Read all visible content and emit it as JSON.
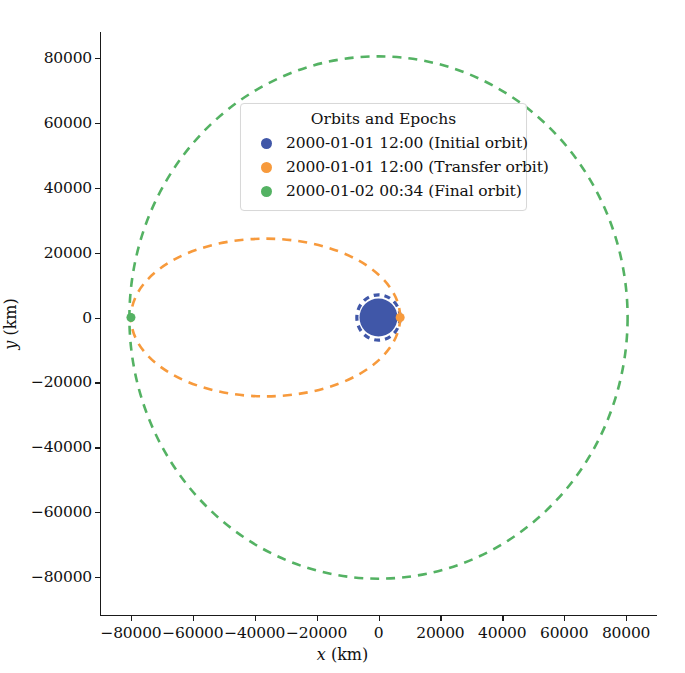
{
  "chart_data": {
    "type": "line",
    "title": "",
    "xlabel": "x (km)",
    "ylabel": "y (km)",
    "xlim": [
      -90000,
      90000
    ],
    "ylim": [
      -92000,
      88000
    ],
    "xticks": [
      "-80000",
      "-60000",
      "-40000",
      "-20000",
      "0",
      "20000",
      "40000",
      "60000",
      "80000"
    ],
    "xtick_values": [
      -80000,
      -60000,
      -40000,
      -20000,
      0,
      20000,
      40000,
      60000,
      80000
    ],
    "yticks": [
      "80000",
      "60000",
      "40000",
      "20000",
      "0",
      "-20000",
      "-40000",
      "-60000",
      "-80000"
    ],
    "ytick_values": [
      80000,
      60000,
      40000,
      20000,
      0,
      -20000,
      -40000,
      -60000,
      -80000
    ],
    "grid": false,
    "legend_position": "upper center",
    "legend_title": "Orbits and Epochs",
    "series": [
      {
        "name": "2000-01-01 12:00 (Initial orbit)",
        "label": "2000-01-01 12:00 (Initial orbit)",
        "color": "#4057a8",
        "style": "dashed",
        "shape": "circle",
        "center": [
          0,
          0
        ],
        "semi_major_axis": 7000,
        "semi_minor_axis": 7000,
        "marker_point": [
          0,
          0
        ],
        "marker_size": 38
      },
      {
        "name": "2000-01-01 12:00 (Transfer orbit)",
        "label": "2000-01-01 12:00 (Transfer orbit)",
        "color": "#f79a3c",
        "style": "dashed",
        "shape": "ellipse",
        "center": [
          -36500,
          0
        ],
        "semi_major_axis": 43500,
        "semi_minor_axis": 24300,
        "marker_point": [
          7000,
          0
        ],
        "marker_size": 9
      },
      {
        "name": "2000-01-02 00:34 (Final orbit)",
        "label": "2000-01-02 00:34 (Final orbit)",
        "color": "#54b263",
        "style": "dashed",
        "shape": "circle",
        "center": [
          0,
          0
        ],
        "semi_major_axis": 80500,
        "semi_minor_axis": 80500,
        "marker_point": [
          -80000,
          0
        ],
        "marker_size": 9
      }
    ]
  },
  "legend": {
    "title": "Orbits and Epochs",
    "items": [
      {
        "label": "2000-01-01 12:00 (Initial orbit)",
        "color": "#4057a8"
      },
      {
        "label": "2000-01-01 12:00 (Transfer orbit)",
        "color": "#f79a3c"
      },
      {
        "label": "2000-01-02 00:34 (Final orbit)",
        "color": "#54b263"
      }
    ]
  },
  "axes": {
    "xlabel_var": "x",
    "xlabel_unit": " (km)",
    "ylabel_var": "y",
    "ylabel_unit": " (km)"
  }
}
